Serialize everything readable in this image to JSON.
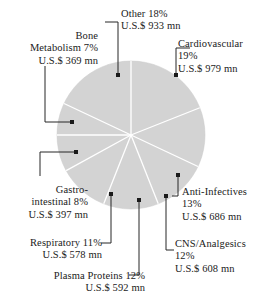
{
  "chart_data": {
    "type": "pie",
    "title": "",
    "subtitle": "",
    "xlabel": "",
    "ylabel": "",
    "legend_position": "callout-labels",
    "grid": false,
    "units": "U.S.$ mn",
    "total_value": 5142,
    "start_angle_deg": 90,
    "direction": "clockwise",
    "slice_color": "#d3d3d3",
    "divider_color": "#ffffff",
    "categories": [
      "Cardiovascular",
      "Anti-Infectives",
      "CNS/Analgesics",
      "Plasma Proteins",
      "Respiratory",
      "Gastro-intestinal",
      "Bone Metabolism",
      "Other"
    ],
    "values": [
      979,
      686,
      608,
      592,
      578,
      397,
      369,
      933
    ],
    "percentages": [
      19,
      13,
      12,
      12,
      11,
      8,
      7,
      18
    ],
    "slices": [
      {
        "name": "Cardiovascular",
        "percent": 19,
        "value": 979,
        "percent_text": "19%",
        "value_text": "U.S.$ 979 mn"
      },
      {
        "name": "Anti-Infectives",
        "percent": 13,
        "value": 686,
        "percent_text": "13%",
        "value_text": "U.S.$ 686 mn"
      },
      {
        "name": "CNS/Analgesics",
        "percent": 12,
        "value": 608,
        "percent_text": "12%",
        "value_text": "U.S.$ 608 mn"
      },
      {
        "name": "Plasma Proteins",
        "percent": 12,
        "value": 592,
        "percent_text": "12%",
        "value_text": "U.S.$ 592 mn"
      },
      {
        "name": "Respiratory",
        "percent": 11,
        "value": 578,
        "percent_text": "11%",
        "value_text": "U.S.$ 578 mn"
      },
      {
        "name": "Gastro-intestinal",
        "percent": 8,
        "value": 397,
        "percent_text": "8%",
        "value_text": "U.S.$ 397 mn"
      },
      {
        "name": "Bone Metabolism",
        "percent": 7,
        "value": 369,
        "percent_text": "7%",
        "value_text": "U.S.$ 369 mn"
      },
      {
        "name": "Other",
        "percent": 18,
        "value": 933,
        "percent_text": "18%",
        "value_text": "U.S.$ 933 mn"
      }
    ]
  },
  "labels": {
    "other": {
      "line1": "Other  18%",
      "line2": "U.S.$ 933 mn"
    },
    "cardiovascular": {
      "line1": "Cardiovascular",
      "line2": "19%",
      "line3": "U.S.$ 979 mn"
    },
    "bone_metabolism": {
      "line1": "Bone",
      "line2": "Metabolism  7%",
      "line3": "U.S.$ 369 mn"
    },
    "gastro_intestinal": {
      "line1": "Gastro-",
      "line2": "intestinal  8%",
      "line3": "U.S.$ 397 mn"
    },
    "respiratory": {
      "line1": "Respiratory  11%",
      "line2": "U.S.$ 578 mn"
    },
    "plasma_proteins": {
      "line1": "Plasma Proteins  12%",
      "line2": "U.S.$ 592 mn"
    },
    "anti_infectives": {
      "line1": "Anti-Infectives",
      "line2": "13%",
      "line3": "U.S.$ 686 mn"
    },
    "cns_analgesics": {
      "line1": "CNS/Analgesics",
      "line2": "12%",
      "line3": "U.S.$ 608 mn"
    }
  }
}
